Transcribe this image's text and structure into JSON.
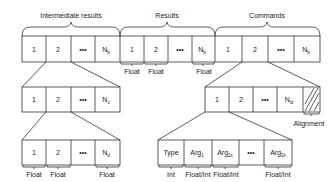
{
  "diagram": {
    "groups": [
      {
        "title": "Intermediate results",
        "cells": [
          "1",
          "2",
          "•••",
          "N_b"
        ]
      },
      {
        "title": "Results",
        "cells": [
          "1",
          "2",
          "•••",
          "N_b"
        ],
        "cell_types": [
          "Float",
          "Float",
          "",
          "Float"
        ]
      },
      {
        "title": "Commands",
        "cells": [
          "1",
          "2",
          "•••",
          "N_b"
        ]
      }
    ],
    "intermediate_level2": {
      "cells": [
        "1",
        "2",
        "•••",
        "N_c"
      ]
    },
    "intermediate_level3": {
      "cells": [
        "1",
        "2",
        "•••",
        "N_d"
      ],
      "cell_types": [
        "Float",
        "Float",
        "",
        "Float"
      ]
    },
    "command_level2": {
      "cells": [
        "1",
        "2",
        "•••",
        "N_id"
      ],
      "alignment_label": "Alignment"
    },
    "command_level3": {
      "cells": [
        "Type",
        "Arg_1",
        "Arg_2x",
        "•••",
        "Arg_3x"
      ],
      "cell_types": [
        "Int",
        "Float/Int",
        "Float/Int",
        "",
        "Float/Int"
      ]
    },
    "labels": {
      "intermediate": "Intermediate results",
      "results": "Results",
      "commands": "Commands",
      "alignment": "Alignment",
      "float": "Float",
      "int": "Int",
      "floatint": "Float/Int",
      "one": "1",
      "two": "2",
      "dots": "•••",
      "N": "N",
      "b": "b",
      "c": "c",
      "d": "d",
      "id": "id",
      "type": "Type",
      "arg": "Arg",
      "s1": "1",
      "s2": "2x",
      "s3": "3x"
    }
  }
}
